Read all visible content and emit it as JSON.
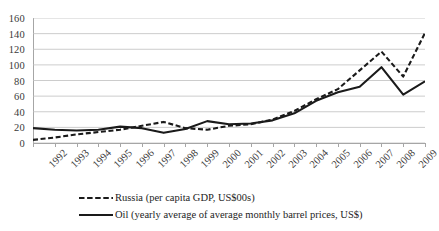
{
  "chart_data": {
    "type": "line",
    "title": "",
    "subtitle": "",
    "xlabel": "",
    "ylabel": "",
    "xlim": [
      1992,
      2010
    ],
    "ylim": [
      0,
      160
    ],
    "ytick_step": 20,
    "grid": true,
    "legend_position": "bottom-left",
    "x": [
      1992,
      1993,
      1994,
      1995,
      1996,
      1997,
      1998,
      1999,
      2000,
      2001,
      2002,
      2003,
      2004,
      2005,
      2006,
      2007,
      2008,
      2009,
      2010
    ],
    "categories": [
      "1992",
      "1993",
      "1994",
      "1995",
      "1996",
      "1997",
      "1998",
      "1999",
      "2000",
      "2001",
      "2002",
      "2003",
      "2004",
      "2005",
      "2006",
      "2007",
      "2008",
      "2009",
      "2010"
    ],
    "yticks": [
      0,
      20,
      40,
      60,
      80,
      100,
      120,
      140,
      160
    ],
    "ytick_labels": [
      "0",
      "20",
      "40",
      "60",
      "80",
      "100",
      "120",
      "140",
      "160"
    ],
    "series": [
      {
        "name": "Russia (per capita GDP, US$00s)",
        "style": "dashed",
        "color": "#1a1a1a",
        "values": [
          4,
          7,
          11,
          14,
          17,
          22,
          27,
          19,
          17,
          22,
          24,
          30,
          41,
          56,
          69,
          93,
          117,
          85,
          141
        ]
      },
      {
        "name": "Oil (yearly average of average monthly barrel prices, US$)",
        "style": "solid",
        "color": "#1a1a1a",
        "values": [
          19,
          17,
          16,
          17,
          21,
          19,
          13,
          18,
          28,
          24,
          25,
          29,
          38,
          54,
          65,
          72,
          97,
          62,
          79
        ]
      }
    ]
  },
  "legend": {
    "items": [
      {
        "label": "Russia (per capita GDP, US$00s)",
        "style": "dashed"
      },
      {
        "label": "Oil (yearly average of average monthly barrel prices, US$)",
        "style": "solid"
      }
    ]
  },
  "colors": {
    "line": "#1a1a1a",
    "grid": "#bfbfbf",
    "axis": "#a6a6a6",
    "tick_text": "#3a3a3a",
    "background": "#ffffff"
  }
}
